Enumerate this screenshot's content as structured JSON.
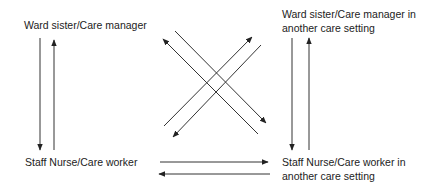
{
  "nodes": {
    "top_left": {
      "line1": "Ward sister/Care manager"
    },
    "top_right": {
      "line1": "Ward sister/Care manager in",
      "line2": "another care setting"
    },
    "bottom_left": {
      "line1": "Staff Nurse/Care worker"
    },
    "bottom_right": {
      "line1": "Staff Nurse/Care worker in",
      "line2": "another care setting"
    }
  },
  "edges": [
    {
      "from": "top_left",
      "to": "bottom_left"
    },
    {
      "from": "bottom_left",
      "to": "top_left"
    },
    {
      "from": "top_right",
      "to": "bottom_right"
    },
    {
      "from": "bottom_right",
      "to": "top_right"
    },
    {
      "from": "bottom_left",
      "to": "bottom_right"
    },
    {
      "from": "bottom_right",
      "to": "bottom_left"
    },
    {
      "from": "top_left",
      "to": "bottom_right"
    },
    {
      "from": "bottom_right",
      "to": "top_left"
    },
    {
      "from": "bottom_left",
      "to": "top_right"
    },
    {
      "from": "top_right",
      "to": "bottom_left"
    }
  ],
  "colors": {
    "line": "#333333",
    "text": "#222222",
    "background": "#ffffff"
  }
}
